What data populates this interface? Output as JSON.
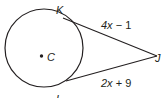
{
  "diagram": {
    "center_label": "C",
    "point_k": "K",
    "point_j": "J",
    "point_l": "L",
    "segment_kj_label_var": "4x",
    "segment_kj_label_rest": " − 1",
    "segment_lj_label_var": "2x",
    "segment_lj_label_rest": " + 9",
    "stroke_color": "#231f20"
  }
}
